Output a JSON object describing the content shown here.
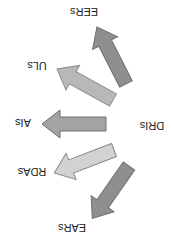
{
  "diagram": {
    "orientation": "rotated-180",
    "center": {
      "label": "DRIs"
    },
    "branches": [
      {
        "label": "EERs",
        "color": "#8f8f8f"
      },
      {
        "label": "ULs",
        "color": "#b8b8b8"
      },
      {
        "label": "AIs",
        "color": "#a3a3a3"
      },
      {
        "label": "RDAs",
        "color": "#d2d2d2"
      },
      {
        "label": "EARs",
        "color": "#8f8f8f"
      }
    ],
    "stroke_color": "#6f6f6f"
  }
}
